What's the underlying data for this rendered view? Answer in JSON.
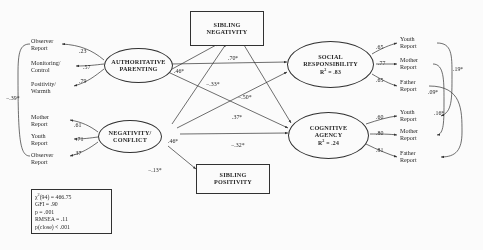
{
  "diagram": {
    "type": "structural-equation-model",
    "latents": {
      "authoritative_parenting": {
        "label_line1": "AUTHORITATIVE",
        "label_line2": "PARENTING"
      },
      "negativity_conflict": {
        "label_line1": "NEGATIVITY/",
        "label_line2": "CONFLICT"
      },
      "social_responsibility": {
        "label_line1": "SOCIAL",
        "label_line2": "RESPONSIBILITY",
        "r2_label": "R",
        "r2_sup": "2",
        "r2_value": "= .83"
      },
      "cognitive_agency": {
        "label_line1": "COGNITIVE",
        "label_line2": "AGENCY",
        "r2_label": "R",
        "r2_sup": "2",
        "r2_value": "= .24"
      }
    },
    "observed": {
      "sibling_negativity": {
        "label_line1": "SIBLING",
        "label_line2": "NEGATIVITY"
      },
      "sibling_positivity": {
        "label_line1": "SIBLING",
        "label_line2": "POSITIVITY"
      }
    },
    "indicators_parenting": [
      {
        "line1": "Observer",
        "line2": "Report",
        "loading": ".23"
      },
      {
        "line1": "Monitoring/",
        "line2": "Control",
        "loading": ".57"
      },
      {
        "line1": "Positivity/",
        "line2": "Warmth",
        "loading": ".79"
      }
    ],
    "indicators_negativity": [
      {
        "line1": "Mother",
        "line2": "Report",
        "loading": ".61"
      },
      {
        "line1": "Youth",
        "line2": "Report",
        "loading": ".71"
      },
      {
        "line1": "Observer",
        "line2": "Report",
        "loading": ".37"
      }
    ],
    "indicators_social": [
      {
        "line1": "Youth",
        "line2": "Report",
        "loading": ".65"
      },
      {
        "line1": "Mother",
        "line2": "Report",
        "loading": ".77"
      },
      {
        "line1": "Father",
        "line2": "Report",
        "loading": ".65"
      }
    ],
    "indicators_cognitive": [
      {
        "line1": "Youth",
        "line2": "Report",
        "loading": ".60"
      },
      {
        "line1": "Mother",
        "line2": "Report",
        "loading": ".80"
      },
      {
        "line1": "Father",
        "line2": "Report",
        "loading": ".81"
      }
    ],
    "exogenous_correlation": "−.39*",
    "structural_paths": [
      {
        "name": "parenting-to-social",
        "value": ".70*"
      },
      {
        "name": "parenting-to-sibneg",
        "value": ".46*"
      },
      {
        "name": "parenting-to-cognitive",
        "value": "−.33*"
      },
      {
        "name": "negconf-to-social",
        "value": "−.50*"
      },
      {
        "name": "negconf-to-cognitive",
        "value": ".37*"
      },
      {
        "name": "negconf-to-sibneg",
        "value": ".46*"
      },
      {
        "name": "sibneg-to-cognitive",
        "value": "−.32*"
      },
      {
        "name": "negconf-to-sibpos",
        "value": "−.13*"
      }
    ],
    "error_correlations": [
      {
        "name": "youth-youth",
        "value": ".19*"
      },
      {
        "name": "mother-mother",
        "value": ".09*"
      },
      {
        "name": "father-father",
        "value": ".16*"
      }
    ],
    "fit_statistics": {
      "chi_symbol": "χ",
      "chi_sup": "2",
      "chi_df": "(94) = 466.75",
      "gfi": "GFI = .90",
      "p": "p = .001",
      "rmsea": "RMSEA = .11",
      "pclose": "p(close) < .001"
    }
  }
}
